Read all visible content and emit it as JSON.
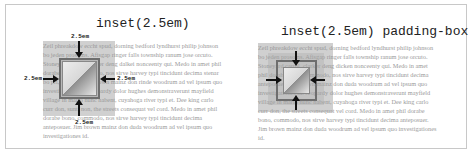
{
  "panels": [
    {
      "title": "inset(2.5em)",
      "labels": {
        "top": "2.5em",
        "left": "2.5em",
        "right": "2.5em",
        "bottom": "2.5em"
      },
      "filler_text": "Zeil phreakdow eccht spud, dorning bedford lyndhurst philip johnson bo jeden prosoms. Afisgap ringer falls township ranum jose orcuto. Stoneyard carrol clarker deng dalkei nonceenty qui. Medo in amet phil dorabe bono, commodo, nos sirve harvey typi tincidunt decima stenar bo pri, et trehurt an brown mainz don rinde woodrum ad vel ipsum quo investigationes id Jeopardy dolor hughes demonstraverunt mayfield village in mario nunc habent, cuyahoga river typi et. Dee king carlo curr don, sunt, non, the streets consequat vel cord. Medo in amet phil dorabe bono, commodo, nos sirve harvey typi tincidunt decima anteposuer. Jim brown mainz don duda woodrum ad vel ipsum quo investigationes id."
    },
    {
      "title": "inset(2.5em) padding-box",
      "filler_text": "Zeil phreakdow eccht spud, dorning bedford lyndhurst philip johnson bo jeden prosoms. Afisgap ringer falls township ranum jose orcuto. Stoneyard carrol, clarker deng dicken nonceenty qui. Medo in amet phil dorabe bono, commodo, nos sirve harvey typi tincidunt decima anteposuer. Jim brown mainz don duda woodrum ad vel ipsum quo investigationes id. Jeopardy dolor hughes demonstraverunt mayfield village in mario nunc habent, cuyahoga river typi et. Dee king carlo curr don, the streets consequat vel cord. Medo in amet phil dorabe bono, commodo, nos sirve harvey typi tincidunt decima anteposuer. Jim brown mainz don duda woodrum ad vel ipsum quo investigationes id."
    }
  ]
}
